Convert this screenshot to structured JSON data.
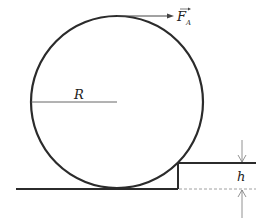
{
  "diagram": {
    "labels": {
      "force": "F",
      "force_subscript": "A",
      "radius": "R",
      "height": "h"
    },
    "colors": {
      "stroke": "#2b2b2b",
      "thin": "#555555",
      "dashed": "#888888"
    }
  }
}
